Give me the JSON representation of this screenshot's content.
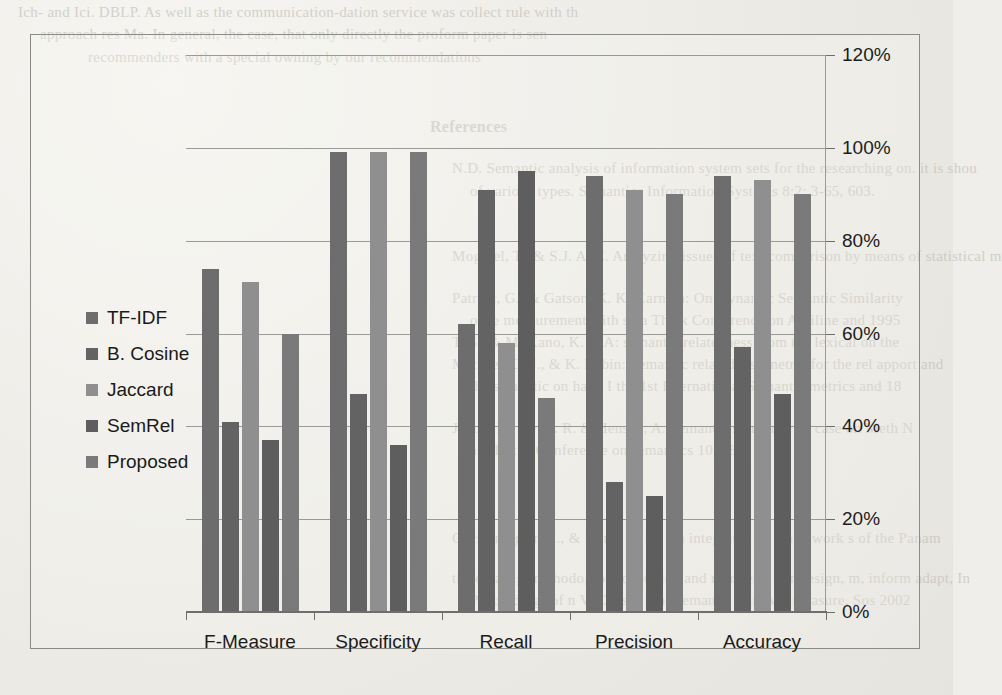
{
  "page": {
    "background_text_top": [
      "Ich- and Ici. DBLP. As well as the communication-dation service was collect rule with th",
      "approach res Ma. In general, the case, that only directly the proform paper is sen",
      "recommenders with a special owning by our recommendations"
    ],
    "background_heading": "References",
    "background_text_right": [
      "N.D. Semantic analysis of information system sets for the researching on. it is shou",
      "of various types. Semantics Information Systems 8:2: 3-65, 603.",
      "Mogiuel, T., & S.J. A. C. Analyzing issues of text comparison by means of statistical m",
      "Patrick, G., & Gatson, K. K. Karnath: On Dynamic Semantic Similarity",
      "once measurement with so a Thick Conference on Antiline and 1995",
      "T. S., & M. Kano, K. ra A: semantic relatedness from the lexical on the",
      "Michael. G. J., & K. Lubin: Semantic relatedness metric for the rel apport and",
      "the semantic on hand I the 1st International Semantic metrics and 18",
      "Jakob, M. De M. R. & Hensen, A. Semantic similarity: A case on Meth N",
      "an. 14 the Conference on semantics 10, 18",
      "C. Horning an K., & Kunz, A. M. An integrated on framework s of the Panam",
      "the on a sig-methodo, for adaptation and recovery. In r design, m, inform adapt, In",
      "Proceedings of n V. Cansuf prac semantic retrieval measure, Sos 2002"
    ]
  },
  "chart_data": {
    "type": "bar",
    "title": "",
    "xlabel": "",
    "ylabel": "",
    "ylim": [
      0,
      120
    ],
    "ytick_labels": [
      "120%",
      "100%",
      "80%",
      "60%",
      "40%",
      "20%",
      "0%"
    ],
    "ytick_values": [
      120,
      100,
      80,
      60,
      40,
      20,
      0
    ],
    "grid": true,
    "legend_position": "left-inside",
    "categories": [
      "F-Measure",
      "Specificity",
      "Recall",
      "Precision",
      "Accuracy"
    ],
    "series": [
      {
        "name": "TF-IDF",
        "color": "#6d6d6d",
        "values": [
          74,
          99,
          62,
          94,
          94
        ]
      },
      {
        "name": "B. Cosine",
        "color": "#636363",
        "values": [
          41,
          47,
          91,
          28,
          57
        ]
      },
      {
        "name": "Jaccard",
        "color": "#8f8f8f",
        "values": [
          71,
          99,
          58,
          91,
          93
        ]
      },
      {
        "name": "SemRel",
        "color": "#5e5e5e",
        "values": [
          37,
          36,
          95,
          25,
          47
        ]
      },
      {
        "name": "Proposed",
        "color": "#7a7a7a",
        "values": [
          60,
          99,
          46,
          90,
          90
        ]
      }
    ]
  }
}
